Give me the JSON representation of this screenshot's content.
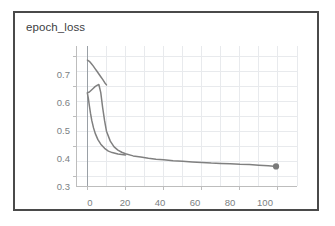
{
  "card": {
    "title": "epoch_loss",
    "border_color": "#4a4a4a",
    "background": "#ffffff"
  },
  "chart_data": {
    "type": "line",
    "title": "epoch_loss",
    "xlabel": "",
    "ylabel": "",
    "xlim": [
      -6,
      110
    ],
    "ylim": [
      0.27,
      0.735
    ],
    "grid": true,
    "legend": "none",
    "line_color": "#808080",
    "grid_color": "#e8eaed",
    "axis_color": "#bdbdbd",
    "zero_line_color": "#9aa0a6",
    "marker": {
      "x": 99,
      "y": 0.335,
      "color": "#7a7a7a",
      "shape": "circle"
    },
    "xticks": [
      0,
      20,
      40,
      60,
      80,
      100
    ],
    "xtick_labels": [
      "0",
      "20",
      "40",
      "60",
      "80",
      "100"
    ],
    "yticks": [
      0.3,
      0.4,
      0.5,
      0.6,
      0.7
    ],
    "ytick_labels": [
      "0.3",
      "0.4",
      "0.5",
      "0.6",
      "0.7"
    ],
    "minor_x_step": 10,
    "minor_y_step": 0.05,
    "series": [
      {
        "name": "epoch_loss_run_a",
        "comment": "short rising-then-falling arc near the origin",
        "x": [
          0,
          1,
          2,
          3,
          4,
          5,
          6,
          7,
          8,
          9,
          10
        ],
        "y": [
          0.688,
          0.684,
          0.677,
          0.669,
          0.66,
          0.651,
          0.642,
          0.633,
          0.624,
          0.614,
          0.606
        ]
      },
      {
        "name": "epoch_loss_run_b",
        "comment": "main exponential decay curve ending at the marker",
        "x": [
          0,
          1,
          2,
          3,
          4,
          5,
          6,
          7,
          8,
          9,
          10,
          12,
          14,
          16,
          18,
          20,
          24,
          28,
          32,
          36,
          40,
          45,
          50,
          55,
          60,
          65,
          70,
          75,
          80,
          85,
          90,
          95,
          99
        ],
        "y": [
          0.58,
          0.582,
          0.588,
          0.594,
          0.6,
          0.604,
          0.607,
          0.58,
          0.53,
          0.487,
          0.452,
          0.419,
          0.4,
          0.389,
          0.382,
          0.377,
          0.37,
          0.366,
          0.362,
          0.359,
          0.357,
          0.354,
          0.352,
          0.35,
          0.348,
          0.346,
          0.345,
          0.344,
          0.342,
          0.341,
          0.339,
          0.337,
          0.335
        ]
      },
      {
        "name": "epoch_loss_run_b_tail",
        "comment": "steep drop from the arc end back down into the decay",
        "x": [
          0,
          0.5,
          1,
          1.6,
          2.3,
          3.2,
          4.2,
          5.5,
          7,
          9,
          11,
          13,
          16,
          20
        ],
        "y": [
          0.578,
          0.56,
          0.537,
          0.512,
          0.487,
          0.463,
          0.443,
          0.424,
          0.409,
          0.395,
          0.386,
          0.381,
          0.376,
          0.373
        ]
      }
    ]
  }
}
